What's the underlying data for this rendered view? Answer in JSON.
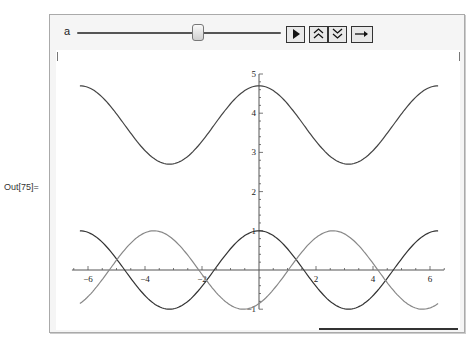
{
  "cell": {
    "out_label": "Out[75]="
  },
  "manipulate": {
    "control": {
      "variable_label": "a",
      "slider_position_fraction": 0.57,
      "buttons": [
        {
          "name": "play-button",
          "icon": "play-icon",
          "glyph": "▶"
        },
        {
          "name": "faster-button",
          "icon": "double-chevron-up-icon",
          "glyph": "⌃⌃"
        },
        {
          "name": "slower-button",
          "icon": "double-chevron-down-icon",
          "glyph": "⌄⌄"
        },
        {
          "name": "direction-button",
          "icon": "arrow-right-icon",
          "glyph": "→"
        }
      ]
    }
  },
  "chart_data": {
    "type": "line",
    "title": "",
    "xlabel": "",
    "ylabel": "",
    "xlim": [
      -6.283,
      6.283
    ],
    "ylim": [
      -1,
      5
    ],
    "grid": false,
    "x_ticks": [
      -6,
      -4,
      -2,
      2,
      4,
      6
    ],
    "y_ticks": [
      -1,
      1,
      2,
      3,
      4,
      5
    ],
    "x_tick_labels": [
      "-6",
      "-4",
      "-2",
      "2",
      "4",
      "6"
    ],
    "y_tick_labels": [
      "-1",
      "1",
      "2",
      "3",
      "4",
      "5"
    ],
    "x": [
      -6.28,
      -5.5,
      -4.71,
      -3.93,
      -3.14,
      -2.36,
      -1.57,
      -0.79,
      0,
      0.79,
      1.57,
      2.36,
      3.14,
      3.93,
      4.71,
      5.5,
      6.28
    ],
    "series": [
      {
        "name": "upper",
        "color": "#444444",
        "values": [
          4.7,
          4.41,
          3.7,
          2.99,
          2.7,
          2.99,
          3.7,
          4.41,
          4.7,
          4.41,
          3.7,
          2.99,
          2.7,
          2.99,
          3.7,
          4.41,
          4.7
        ]
      },
      {
        "name": "cos",
        "color": "#333333",
        "values": [
          1,
          0.71,
          0,
          -0.71,
          -1,
          -0.71,
          0,
          0.71,
          1,
          0.71,
          0,
          -0.71,
          -1,
          -0.71,
          0,
          0.71,
          1
        ]
      },
      {
        "name": "shifted",
        "color": "#888888",
        "values": [
          -0.86,
          -0.06,
          0.52,
          0.97,
          0.86,
          0.54,
          -0.52,
          -0.32,
          -0.86,
          -0.06,
          0.52,
          0.97,
          0.86,
          0.54,
          -0.52,
          -0.32,
          -0.86
        ]
      }
    ],
    "curve_functions": {
      "upper": {
        "offset": 3.7,
        "amp": 1,
        "shift": 0
      },
      "cos": {
        "offset": 0,
        "amp": 1,
        "shift": 0
      },
      "shifted": {
        "offset": 0,
        "amp": 1,
        "shift": 2.6
      }
    }
  }
}
